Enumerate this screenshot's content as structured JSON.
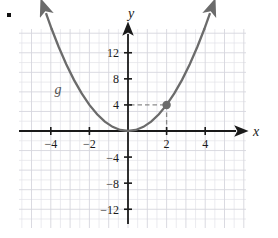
{
  "figure": {
    "bullet": "▪",
    "background": "#ffffff",
    "grid_color": "#e3e3e8",
    "grid_major_color": "#d6d6de",
    "axis_color": "#1a1a1a",
    "curve_color": "#6b6b6b",
    "point_color": "#6b6b6b",
    "dash_color": "#8a8a8a"
  },
  "chart_data": {
    "type": "line",
    "title": "",
    "xlabel": "x",
    "ylabel": "y",
    "function_label": "g",
    "expression": "g(x) = x^2",
    "xlim": [
      -5.7,
      6.2
    ],
    "ylim": [
      -15.5,
      16.5
    ],
    "grid": true,
    "grid_minor_step_x": 0.5,
    "grid_minor_step_y": 1.5,
    "legend": "none",
    "x_ticks": [
      -4,
      -2,
      2,
      4
    ],
    "x_tick_labels": [
      "−4",
      "−2",
      "2",
      "4"
    ],
    "y_ticks": [
      12,
      8,
      4,
      -4,
      -8,
      -12
    ],
    "y_tick_labels": [
      "12",
      "8",
      "4",
      "−4",
      "−8",
      "−12"
    ],
    "series": [
      {
        "name": "g",
        "x": [
          -3.95,
          -3.6,
          -3.2,
          -2.8,
          -2.4,
          -2.0,
          -1.6,
          -1.2,
          -0.8,
          -0.4,
          0,
          0.4,
          0.8,
          1.2,
          1.6,
          2.0,
          2.4,
          2.8,
          3.2,
          3.6,
          3.95
        ],
        "y": [
          15.6,
          12.96,
          10.24,
          7.84,
          5.76,
          4.0,
          2.56,
          1.44,
          0.64,
          0.16,
          0,
          0.16,
          0.64,
          1.44,
          2.56,
          4.0,
          5.76,
          7.84,
          10.24,
          12.96,
          15.6
        ]
      }
    ],
    "annotations": [
      {
        "name": "marked-point",
        "x": 2,
        "y": 4,
        "label": "",
        "guide_horizontal": true,
        "guide_vertical": true
      }
    ]
  }
}
